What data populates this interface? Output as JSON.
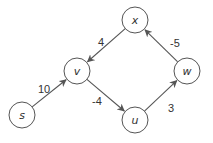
{
  "graph": {
    "nodes": [
      {
        "id": "x",
        "label": "x",
        "cx": 135,
        "cy": 20
      },
      {
        "id": "v",
        "label": "v",
        "cx": 77,
        "cy": 71
      },
      {
        "id": "w",
        "label": "w",
        "cx": 187,
        "cy": 71
      },
      {
        "id": "s",
        "label": "s",
        "cx": 22,
        "cy": 115
      },
      {
        "id": "u",
        "label": "u",
        "cx": 135,
        "cy": 120
      }
    ],
    "edges": [
      {
        "from": "s",
        "to": "v",
        "weight": "10",
        "lx": 38,
        "ly": 93
      },
      {
        "from": "x",
        "to": "v",
        "weight": "4",
        "lx": 98,
        "ly": 46
      },
      {
        "from": "v",
        "to": "u",
        "weight": "-4",
        "lx": 92,
        "ly": 105
      },
      {
        "from": "u",
        "to": "w",
        "weight": "3",
        "lx": 168,
        "ly": 112
      },
      {
        "from": "w",
        "to": "x",
        "weight": "-5",
        "lx": 170,
        "ly": 47
      }
    ],
    "node_radius": 13
  }
}
